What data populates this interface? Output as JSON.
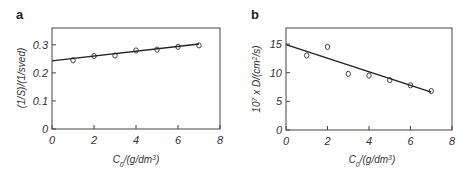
{
  "chart_data": [
    {
      "type": "scatter",
      "panel_label": "a",
      "title": "",
      "xlabel": "C0/(g/dm3)",
      "ylabel": "(1/S)/(1/sved)",
      "xlim": [
        0,
        8
      ],
      "ylim": [
        0,
        0.36
      ],
      "xticks": [
        0,
        2,
        4,
        6,
        8
      ],
      "yticks": [
        0,
        0.1,
        0.2,
        0.3
      ],
      "xtick_labels": [
        "0",
        "2",
        "4",
        "6",
        "8"
      ],
      "ytick_labels": [
        "0",
        "0.1",
        "0.2",
        "0.3"
      ],
      "grid": false,
      "series": [
        {
          "name": "data",
          "marker": "open-circle",
          "x": [
            1,
            2,
            3,
            4,
            5,
            6,
            7
          ],
          "y": [
            0.245,
            0.26,
            0.262,
            0.28,
            0.283,
            0.293,
            0.298
          ]
        },
        {
          "name": "fit",
          "style": "line",
          "x": [
            0,
            7
          ],
          "y": [
            0.243,
            0.303
          ]
        }
      ]
    },
    {
      "type": "scatter",
      "panel_label": "b",
      "title": "",
      "xlabel": "C0/(g/dm3)",
      "ylabel": "10^7 x D/(cm2/s)",
      "xlim": [
        0,
        8
      ],
      "ylim": [
        0,
        17.8
      ],
      "xticks": [
        0,
        2,
        4,
        6,
        8
      ],
      "yticks": [
        0,
        5,
        10,
        15
      ],
      "xtick_labels": [
        "0",
        "2",
        "4",
        "6",
        "8"
      ],
      "ytick_labels": [
        "0",
        "5",
        "10",
        "15"
      ],
      "grid": false,
      "series": [
        {
          "name": "data",
          "marker": "open-circle",
          "x": [
            1,
            2,
            3,
            4,
            5,
            6,
            7
          ],
          "y": [
            13.0,
            14.5,
            9.8,
            9.5,
            8.7,
            7.8,
            6.8
          ]
        },
        {
          "name": "fit",
          "style": "line",
          "x": [
            0,
            7
          ],
          "y": [
            14.9,
            6.6
          ]
        }
      ]
    }
  ],
  "panels": {
    "a": {
      "label": "a",
      "xlabel_main": "C",
      "xlabel_sub": "0",
      "xlabel_rest": "/(g/dm",
      "xlabel_sup": "3",
      "xlabel_end": ")",
      "ylabel": "(1/S)/(1/sved)"
    },
    "b": {
      "label": "b",
      "xlabel_main": "C",
      "xlabel_sub": "0",
      "xlabel_rest": "/(g/dm",
      "xlabel_sup": "3",
      "xlabel_end": ")",
      "ylabel_pre": "10",
      "ylabel_sup1": "7",
      "ylabel_mid": " x D/(cm",
      "ylabel_sup2": "2",
      "ylabel_end": "/s)"
    }
  }
}
